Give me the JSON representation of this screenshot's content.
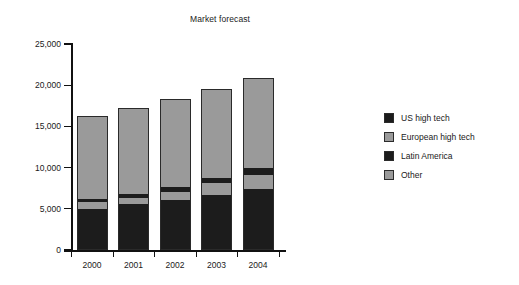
{
  "chart_data": {
    "type": "bar",
    "title": "Market forecast",
    "xlabel": "",
    "ylabel": "",
    "stacked": true,
    "grid": false,
    "legend_position": "right",
    "ylim": [
      0,
      25000
    ],
    "ytick_values": [
      0,
      5000,
      10000,
      15000,
      20000,
      25000
    ],
    "ytick_labels": [
      "0",
      "5,000",
      "10,000",
      "15,000",
      "20,000",
      "25,000"
    ],
    "categories": [
      "2000",
      "2001",
      "2002",
      "2003",
      "2004"
    ],
    "series": [
      {
        "name": "Latin America",
        "color": "#1c1c1c",
        "values": [
          4950,
          5550,
          6100,
          6700,
          7400
        ]
      },
      {
        "name": "European high tech",
        "color": "#9a9a9a",
        "values": [
          900,
          800,
          900,
          1400,
          1700
        ]
      },
      {
        "name": "US high tech",
        "color": "#1c1c1c",
        "values": [
          400,
          450,
          600,
          700,
          900
        ]
      },
      {
        "name": "Other",
        "color": "#9a9a9a",
        "values": [
          10000,
          10400,
          10700,
          10800,
          10900
        ]
      }
    ],
    "totals": [
      16250,
      17200,
      18300,
      19600,
      20900
    ]
  },
  "legend": {
    "items": [
      {
        "label": "US high tech",
        "color": "#1c1c1c"
      },
      {
        "label": "European high tech",
        "color": "#9a9a9a"
      },
      {
        "label": "Latin America",
        "color": "#1c1c1c"
      },
      {
        "label": "Other",
        "color": "#9a9a9a"
      }
    ]
  }
}
